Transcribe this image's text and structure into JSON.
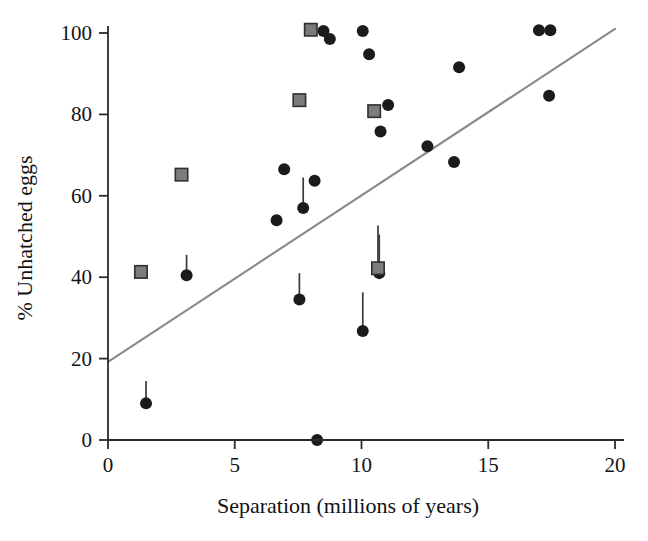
{
  "chart_data": {
    "type": "scatter",
    "title": "",
    "xlabel": "Separation (millions of years)",
    "ylabel": "% Unhatched eggs",
    "xlim": [
      0,
      20
    ],
    "ylim": [
      0,
      101
    ],
    "xticks": [
      0,
      5,
      10,
      15,
      20
    ],
    "yticks": [
      0,
      20,
      40,
      60,
      80,
      100
    ],
    "xtick_labels": [
      "0",
      "5",
      "10",
      "15",
      "20"
    ],
    "ytick_labels": [
      "0",
      "20",
      "40",
      "60",
      "80",
      "100"
    ],
    "grid": false,
    "legend": "none",
    "series": [
      {
        "name": "circles",
        "marker": "circle",
        "color": "#1b1b1b",
        "points": [
          {
            "x": 1.5,
            "y": 9.0,
            "err_up": 5.5
          },
          {
            "x": 3.1,
            "y": 40.5,
            "err_up": 5.0
          },
          {
            "x": 6.65,
            "y": 54.0,
            "err_up": 0
          },
          {
            "x": 6.95,
            "y": 66.5,
            "err_up": 0
          },
          {
            "x": 7.55,
            "y": 34.5,
            "err_up": 6.5
          },
          {
            "x": 7.7,
            "y": 57.0,
            "err_up": 7.5
          },
          {
            "x": 8.15,
            "y": 63.7,
            "err_up": 0
          },
          {
            "x": 8.25,
            "y": 0.0,
            "err_up": 0
          },
          {
            "x": 8.5,
            "y": 100.5,
            "err_up": 0
          },
          {
            "x": 8.75,
            "y": 98.5,
            "err_up": 0
          },
          {
            "x": 10.05,
            "y": 26.8,
            "err_up": 9.5
          },
          {
            "x": 10.05,
            "y": 100.5,
            "err_up": 0
          },
          {
            "x": 10.3,
            "y": 94.8,
            "err_up": 0
          },
          {
            "x": 10.7,
            "y": 41.0,
            "err_up": 9.5
          },
          {
            "x": 10.75,
            "y": 75.8,
            "err_up": 0
          },
          {
            "x": 11.05,
            "y": 82.3,
            "err_up": 0
          },
          {
            "x": 12.6,
            "y": 72.2,
            "err_up": 0
          },
          {
            "x": 13.65,
            "y": 68.3,
            "err_up": 0
          },
          {
            "x": 13.85,
            "y": 91.6,
            "err_up": 0
          },
          {
            "x": 17.0,
            "y": 100.7,
            "err_up": 0
          },
          {
            "x": 17.45,
            "y": 100.7,
            "err_up": 0
          },
          {
            "x": 17.4,
            "y": 84.6,
            "err_up": 0
          }
        ]
      },
      {
        "name": "squares",
        "marker": "square",
        "color": "#7c7c7c",
        "points": [
          {
            "x": 1.3,
            "y": 41.3,
            "err_up": 0
          },
          {
            "x": 2.9,
            "y": 65.2,
            "err_up": 0
          },
          {
            "x": 7.55,
            "y": 83.5,
            "err_up": 0
          },
          {
            "x": 8.0,
            "y": 100.8,
            "err_up": 0
          },
          {
            "x": 10.5,
            "y": 80.8,
            "err_up": 0
          },
          {
            "x": 10.65,
            "y": 42.2,
            "err_up": 10.5
          }
        ]
      }
    ],
    "trend_line": {
      "name": "regression-line",
      "color": "#8a8a8a",
      "x_start": 0.0,
      "y_start": 19.2,
      "x_end": 20.0,
      "y_end": 101.0
    }
  }
}
